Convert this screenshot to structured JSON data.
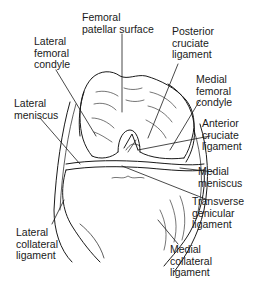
{
  "diagram": {
    "colors": {
      "line": "#1a1a1a",
      "background": "#ffffff"
    },
    "labels": [
      {
        "id": "femoral-patellar-surface",
        "text": "Femoral\npatellar surface"
      },
      {
        "id": "lateral-femoral-condyle",
        "text": "Lateral\nfemoral\ncondyle"
      },
      {
        "id": "posterior-cruciate-ligament",
        "text": "Posterior\ncruciate\nligament"
      },
      {
        "id": "medial-femoral-condyle",
        "text": "Medial\nfemoral\ncondyle"
      },
      {
        "id": "lateral-meniscus",
        "text": "Lateral\nmeniscus"
      },
      {
        "id": "anterior-cruciate-ligament",
        "text": "Anterior\ncruciate\nligament"
      },
      {
        "id": "medial-meniscus",
        "text": "Medial\nmeniscus"
      },
      {
        "id": "transverse-genicular-ligament",
        "text": "Transverse\ngenicular\nligament"
      },
      {
        "id": "lateral-collateral-ligament",
        "text": "Lateral\ncollateral\nligament"
      },
      {
        "id": "medial-collateral-ligament",
        "text": "Medial\ncollateral\nligament"
      }
    ]
  }
}
